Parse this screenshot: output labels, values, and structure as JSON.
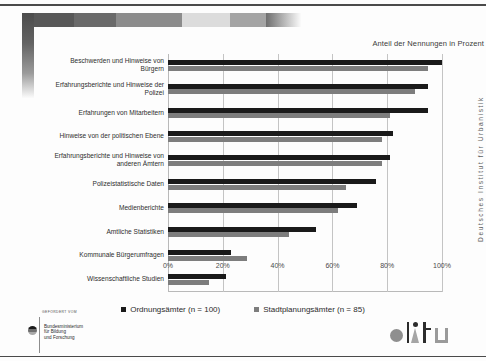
{
  "figure": {
    "axis_title": "Anteil der Nennungen in Prozent",
    "side_caption": "Deutsches Institut für Urbanistik"
  },
  "legend": {
    "items": [
      {
        "label": "Ordnungsämter (n = 100)",
        "color": "#1a1a1a",
        "swatch": "dark"
      },
      {
        "label": "Stadtplanungsämter (n = 85)",
        "color": "#7d7d7d",
        "swatch": "light"
      }
    ]
  },
  "footer": {
    "bmbf_kicker": "GEFÖRDERT VOM",
    "bmbf_name": "Bundesministerium\nfür Bildung\nund Forschung",
    "difu_label": "difu"
  },
  "chart_data": {
    "type": "bar",
    "orientation": "horizontal",
    "title": "",
    "xlabel": "Anteil der Nennungen in Prozent",
    "ylabel": "",
    "xlim": [
      0,
      100
    ],
    "xticks": [
      "0%",
      "20%",
      "40%",
      "60%",
      "80%",
      "100%"
    ],
    "xtick_values": [
      0,
      20,
      40,
      60,
      80,
      100
    ],
    "grid": true,
    "legend_position": "bottom-center",
    "categories": [
      "Beschwerden und Hinweise von Bürgern",
      "Erfahrungsberichte und Hinweise der Polizei",
      "Erfahrungen von Mitarbeitern",
      "Hinweise von der politischen Ebene",
      "Erfahrungsberichte und Hinweise von anderen Ämtern",
      "Polizeistatistische Daten",
      "Medienberichte",
      "Amtliche Statistiken",
      "Kommunale Bürgerumfragen",
      "Wissenschaftliche Studien"
    ],
    "category_lines": [
      [
        "Beschwerden und Hinweise von",
        "Bürgern"
      ],
      [
        "Erfahrungsberichte und Hinweise der",
        "Polizei"
      ],
      [
        "Erfahrungen von Mitarbeitern"
      ],
      [
        "Hinweise von der politischen Ebene"
      ],
      [
        "Erfahrungsberichte und Hinweise von",
        "anderen Ämtern"
      ],
      [
        "Polizeistatistische Daten"
      ],
      [
        "Medienberichte"
      ],
      [
        "Amtliche Statistiken"
      ],
      [
        "Kommunale Bürgerumfragen"
      ],
      [
        "Wissenschaftliche Studien"
      ]
    ],
    "series": [
      {
        "name": "Ordnungsämter (n = 100)",
        "color": "#1a1a1a",
        "values": [
          100,
          95,
          95,
          82,
          81,
          76,
          69,
          54,
          23,
          21
        ]
      },
      {
        "name": "Stadtplanungsämter (n = 85)",
        "color": "#7d7d7d",
        "values": [
          95,
          90,
          81,
          78,
          78,
          65,
          62,
          44,
          29,
          15
        ]
      }
    ]
  }
}
